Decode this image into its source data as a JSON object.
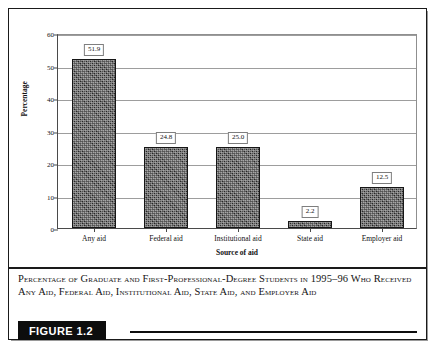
{
  "figure": {
    "badge_label": "FIGURE 1.2",
    "caption": "Percentage of Graduate and First-Professional-Degree Students in 1995–96 Who Received Any Aid, Federal Aid, Institutional Aid, State Aid, and Employer Aid"
  },
  "chart_data": {
    "type": "bar",
    "title": "",
    "xlabel": "Source of aid",
    "ylabel": "Percentage",
    "categories": [
      "Any aid",
      "Federal aid",
      "Institutional aid",
      "State aid",
      "Employer aid"
    ],
    "values": [
      51.9,
      24.8,
      25.0,
      2.2,
      12.5
    ],
    "value_labels": [
      "51.9",
      "24.8",
      "25.0",
      "2.2",
      "12.5"
    ],
    "ylim": [
      0,
      60
    ],
    "ytick_values": [
      0,
      10,
      20,
      30,
      40,
      50,
      60
    ],
    "ytick_labels": [
      "0",
      "10",
      "20",
      "30",
      "40",
      "50",
      "60"
    ],
    "grid": true,
    "legend": false,
    "bar_color": "#3a3a3a",
    "bar_edge_color": "#161616",
    "gridline_color": "#9d9d9d",
    "axis_color": "#4a4a4a"
  }
}
